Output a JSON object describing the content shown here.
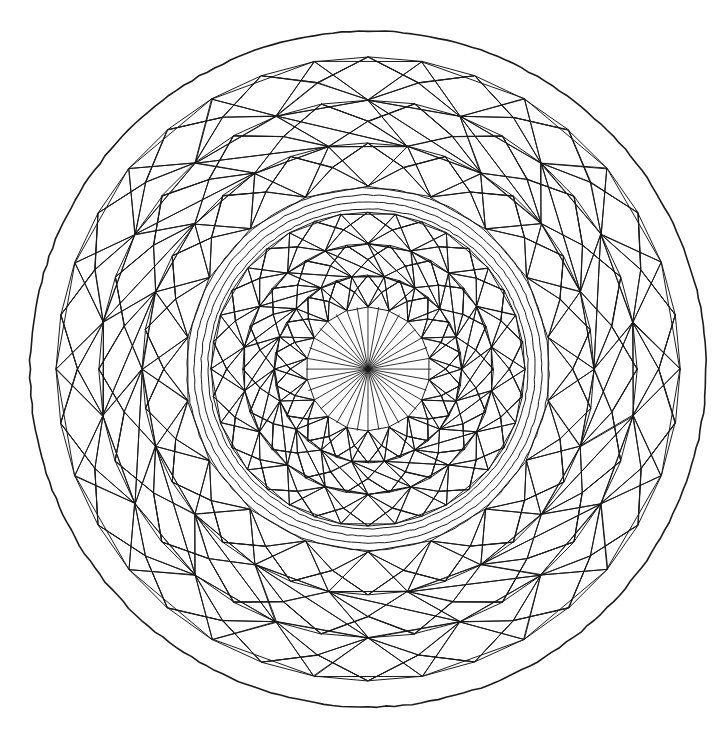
{
  "page": {
    "width": 725,
    "height": 735,
    "background_color": "#ffffff",
    "ink_color": "#1a1a1a"
  },
  "geometry": {
    "center": {
      "x": 368,
      "y": 369
    },
    "outer_circle_radius": 338,
    "symmetry_fold": 18,
    "inner_symmetry_fold": 18
  },
  "rings": [
    {
      "name": "outer-boundary-circle",
      "kind": "circle",
      "radius": 338,
      "stroke_width": 1.6
    },
    {
      "name": "outer-blank-margin",
      "kind": "blank-band",
      "inner_radius": 312,
      "outer_radius": 338
    },
    {
      "name": "outer-rhombus-band",
      "kind": "rhombus-tiling",
      "inner_radius": 183,
      "outer_radius": 312,
      "fold": 18,
      "rows": 3,
      "stroke_width": 1.0
    },
    {
      "name": "concentric-circle-group",
      "kind": "circle-group",
      "radii": [
        181,
        174,
        167,
        160
      ],
      "stroke_width": 1.0
    },
    {
      "name": "inner-rhombus-band",
      "kind": "rhombus-tiling",
      "inner_radius": 62,
      "outer_radius": 157,
      "fold": 18,
      "rows": 3,
      "stroke_width": 1.0
    },
    {
      "name": "central-star-burst",
      "kind": "radial-rays",
      "inner_radius": 0,
      "outer_radius": 62,
      "ray_count": 36,
      "stroke_width": 0.9
    }
  ],
  "chart_data": {
    "type": "radial-tiling",
    "center": [
      368,
      369
    ],
    "outer_radius": 338,
    "bands": [
      {
        "label": "boundary circle",
        "r_inner": 338,
        "r_outer": 338,
        "fold": 0
      },
      {
        "label": "outer rhombus tiling",
        "r_inner": 183,
        "r_outer": 312,
        "fold": 18
      },
      {
        "label": "concentric rings",
        "r_inner": 160,
        "r_outer": 181,
        "fold": 0
      },
      {
        "label": "inner rhombus tiling",
        "r_inner": 62,
        "r_outer": 157,
        "fold": 18
      },
      {
        "label": "star burst",
        "r_inner": 0,
        "r_outer": 62,
        "fold": 36
      }
    ],
    "circle_radii": [
      338,
      181,
      174,
      167,
      160
    ],
    "ray_count": 36,
    "xlabel": "",
    "ylabel": "",
    "legend": []
  }
}
